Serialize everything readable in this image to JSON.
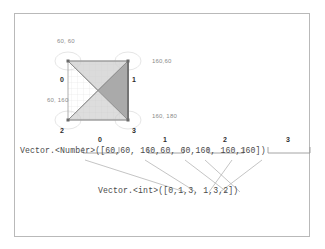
{
  "figure": {
    "diagram": {
      "coord_labels": [
        {
          "text": "60, 60",
          "x": 22,
          "y": 14
        },
        {
          "text": "160,60",
          "x": 118,
          "y": 37
        },
        {
          "text": "60, 160",
          "x": 14,
          "y": 74
        },
        {
          "text": "160, 180",
          "x": 118,
          "y": 88
        }
      ],
      "vertex_labels": [
        {
          "text": "0",
          "x": 26,
          "y": 54
        },
        {
          "text": "1",
          "x": 100,
          "y": 54
        },
        {
          "text": "2",
          "x": 26,
          "y": 102
        },
        {
          "text": "3",
          "x": 100,
          "y": 102
        }
      ],
      "vertices": {
        "v0": [
          33,
          33
        ],
        "v1": [
          93,
          33
        ],
        "v2": [
          33,
          92
        ],
        "v3": [
          93,
          92
        ]
      },
      "triangle_a": "0,1,3",
      "triangle_b": "1,3,2",
      "fill_light": "#d0d0d0",
      "fill_dark": "#a8a8a8",
      "stroke": "#8f8f8f",
      "grid_color": "#dcdcdc",
      "halo_color": "#e2e2e2"
    },
    "index_ruler": {
      "labels": [
        "0",
        "1",
        "2",
        "3"
      ],
      "bracket_x": [
        68,
        133,
        193,
        253
      ],
      "bracket_w": [
        36,
        36,
        40,
        42
      ]
    },
    "code": {
      "number_vector": "Vector.<Number>([60,60, 160,60, 60,160, 160,160])",
      "int_vector": "Vector.<int>([0,1,3, 1,3,2])"
    },
    "connector_color": "#b5b5b5",
    "frame_color": "#b9b9b9",
    "background": "#ffffff"
  }
}
